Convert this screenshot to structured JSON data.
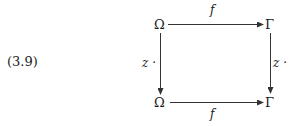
{
  "equation": {
    "number": "(3.9)"
  },
  "diagram": {
    "type": "commutative-square",
    "nodes": {
      "top_left": "Ω",
      "top_right": "Γ",
      "bottom_left": "Ω",
      "bottom_right": "Γ"
    },
    "arrows": {
      "top": {
        "from": "top_left",
        "to": "top_right",
        "label": "f"
      },
      "bottom": {
        "from": "bottom_left",
        "to": "bottom_right",
        "label": "f"
      },
      "left": {
        "from": "top_left",
        "to": "bottom_left",
        "label": "z ·"
      },
      "right": {
        "from": "top_right",
        "to": "bottom_right",
        "label": "z ·"
      }
    },
    "stroke_color": "#333333"
  }
}
